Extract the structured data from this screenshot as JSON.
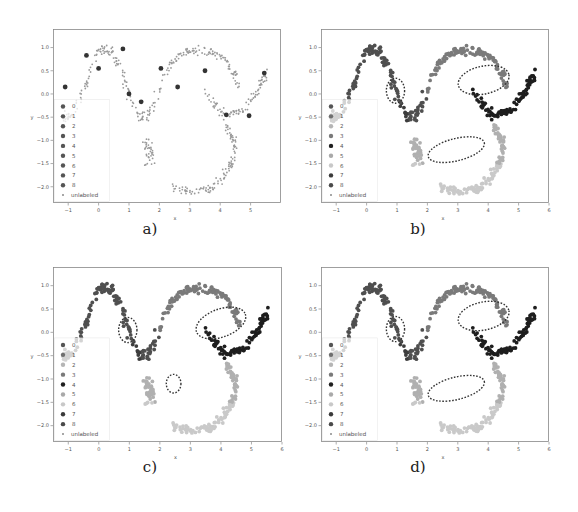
{
  "figure": {
    "panels": [
      {
        "id": "a",
        "caption": "a)",
        "left": 53,
        "top": 29,
        "width": 228,
        "height": 174,
        "captionX": 150,
        "captionY": 230,
        "mode": "sparse",
        "ellipses": []
      },
      {
        "id": "b",
        "caption": "b)",
        "left": 321,
        "top": 29,
        "width": 228,
        "height": 174,
        "captionX": 418,
        "captionY": 230,
        "mode": "labeled",
        "ellipses": [
          {
            "cx": 0.95,
            "cy": 0.07,
            "rx": 0.3,
            "ry": 0.27,
            "rot": 0
          },
          {
            "cx": 3.85,
            "cy": 0.3,
            "rx": 0.85,
            "ry": 0.3,
            "rot": -12
          },
          {
            "cx": 2.95,
            "cy": -1.2,
            "rx": 0.95,
            "ry": 0.24,
            "rot": -14
          }
        ]
      },
      {
        "id": "c",
        "caption": "c)",
        "left": 53,
        "top": 267,
        "width": 229,
        "height": 175,
        "captionX": 150,
        "captionY": 468,
        "mode": "labeled",
        "ellipses": [
          {
            "cx": 0.95,
            "cy": 0.05,
            "rx": 0.3,
            "ry": 0.27,
            "rot": 0
          },
          {
            "cx": 4.0,
            "cy": 0.2,
            "rx": 0.85,
            "ry": 0.3,
            "rot": -20
          },
          {
            "cx": 2.45,
            "cy": -1.1,
            "rx": 0.24,
            "ry": 0.2,
            "rot": 0
          }
        ]
      },
      {
        "id": "d",
        "caption": "d)",
        "left": 321,
        "top": 267,
        "width": 228,
        "height": 175,
        "captionX": 418,
        "captionY": 468,
        "mode": "labeled",
        "ellipses": [
          {
            "cx": 0.95,
            "cy": 0.07,
            "rx": 0.3,
            "ry": 0.27,
            "rot": 0
          },
          {
            "cx": 3.85,
            "cy": 0.35,
            "rx": 0.85,
            "ry": 0.3,
            "rot": -12
          },
          {
            "cx": 2.95,
            "cy": -1.2,
            "rx": 0.95,
            "ry": 0.24,
            "rot": -14
          }
        ]
      }
    ]
  },
  "chart_data": [
    {
      "type": "scatter",
      "title": "a)",
      "xlabel": "x",
      "ylabel": "y",
      "xlim": [
        -1.5,
        6.0
      ],
      "ylim": [
        -2.35,
        1.4
      ],
      "xticks": [
        -1,
        0,
        1,
        2,
        3,
        4,
        5
      ],
      "yticks": [
        1.0,
        0.5,
        0.0,
        -0.5,
        -1.0,
        -1.5,
        -2.0
      ],
      "grid": false,
      "legend": {
        "position": "lower left",
        "entries": [
          "0",
          "1",
          "2",
          "3",
          "4",
          "5",
          "6",
          "7",
          "8",
          "unlabeled"
        ]
      },
      "description": "Mostly unlabeled points (small dots) along three interleaved moon curves, with a few larger labeled points",
      "labeled_points": [
        {
          "x": -1.1,
          "y": 0.15
        },
        {
          "x": -0.4,
          "y": 0.83
        },
        {
          "x": 0.0,
          "y": 0.55
        },
        {
          "x": 0.8,
          "y": 0.97
        },
        {
          "x": 1.0,
          "y": 0.0
        },
        {
          "x": 1.4,
          "y": -0.17
        },
        {
          "x": 2.05,
          "y": 0.55
        },
        {
          "x": 2.6,
          "y": 0.15
        },
        {
          "x": 3.5,
          "y": 0.5
        },
        {
          "x": 4.2,
          "y": -0.45
        },
        {
          "x": 4.95,
          "y": -0.47
        },
        {
          "x": 5.45,
          "y": 0.45
        }
      ]
    },
    {
      "type": "scatter",
      "title": "b)",
      "xlabel": "x",
      "ylabel": "y",
      "xlim": [
        -1.5,
        6.0
      ],
      "ylim": [
        -2.35,
        1.4
      ],
      "xticks": [
        -1,
        0,
        1,
        2,
        3,
        4,
        5,
        6
      ],
      "yticks": [
        1.0,
        0.5,
        0.0,
        -0.5,
        -1.0,
        -1.5,
        -2.0
      ],
      "legend": {
        "position": "lower left",
        "entries": [
          "0",
          "1",
          "2",
          "3",
          "4",
          "5",
          "6",
          "7",
          "8",
          "unlabeled"
        ]
      },
      "annotations": [
        "dashed ellipse at (0.95, 0.07)",
        "dashed ellipse at (3.85, 0.3)",
        "dashed ellipse at (2.95, -1.2)"
      ]
    },
    {
      "type": "scatter",
      "title": "c)",
      "xlabel": "x",
      "ylabel": "y",
      "xlim": [
        -1.5,
        6.0
      ],
      "ylim": [
        -2.35,
        1.4
      ],
      "xticks": [
        -1,
        0,
        1,
        2,
        3,
        4,
        5,
        6
      ],
      "yticks": [
        1.0,
        0.5,
        0.0,
        -0.5,
        -1.0,
        -1.5,
        -2.0
      ],
      "legend": {
        "position": "lower left",
        "entries": [
          "0",
          "1",
          "2",
          "3",
          "4",
          "5",
          "6",
          "7",
          "8",
          "unlabeled"
        ]
      },
      "annotations": [
        "dashed ellipse at (0.95, 0.05)",
        "dashed ellipse at (4.0, 0.2)",
        "small dashed circle at (2.45, -1.1)"
      ]
    },
    {
      "type": "scatter",
      "title": "d)",
      "xlabel": "x",
      "ylabel": "y",
      "xlim": [
        -1.5,
        6.0
      ],
      "ylim": [
        -2.35,
        1.4
      ],
      "xticks": [
        -1,
        0,
        1,
        2,
        3,
        4,
        5,
        6
      ],
      "yticks": [
        1.0,
        0.5,
        0.0,
        -0.5,
        -1.0,
        -1.5,
        -2.0
      ],
      "legend": {
        "position": "lower left",
        "entries": [
          "0",
          "1",
          "2",
          "3",
          "4",
          "5",
          "6",
          "7",
          "8",
          "unlabeled"
        ]
      },
      "annotations": [
        "dashed ellipse at (0.95, 0.07)",
        "dashed ellipse at (3.85, 0.35)",
        "dashed ellipse at (2.95, -1.2)"
      ]
    }
  ],
  "legend": {
    "entries": [
      {
        "label": "0",
        "color": "#555555"
      },
      {
        "label": "1",
        "color": "#6f6f6f"
      },
      {
        "label": "2",
        "color": "#b5b5b5"
      },
      {
        "label": "3",
        "color": "#7a7a7a"
      },
      {
        "label": "4",
        "color": "#1e1e1e"
      },
      {
        "label": "5",
        "color": "#a9a9a9"
      },
      {
        "label": "6",
        "color": "#c8c8c8"
      },
      {
        "label": "7",
        "color": "#3a3a3a"
      },
      {
        "label": "8",
        "color": "#4a4a4a"
      },
      {
        "label": "unlabeled",
        "color": "#8a8a8a"
      }
    ]
  },
  "clusters": [
    {
      "name": "left-moon",
      "cls": 0,
      "color": "#4f4f4f",
      "x0": -1.15,
      "x1": 1.95,
      "kind": "wave",
      "amp": 0.75,
      "n": 150
    },
    {
      "name": "upper-right-moon",
      "cls": 1,
      "color": "#7a7a7a",
      "x0": 1.95,
      "x1": 4.55,
      "kind": "arch",
      "n": 110
    },
    {
      "name": "right-tail",
      "cls": 4,
      "color": "#1e1e1e",
      "x0": 3.5,
      "x1": 5.55,
      "kind": "tail",
      "n": 90
    },
    {
      "name": "lower-moon",
      "cls": 5,
      "color": "#b0b0b0",
      "x0": 1.4,
      "x1": 4.6,
      "kind": "lower",
      "n": 150
    }
  ]
}
